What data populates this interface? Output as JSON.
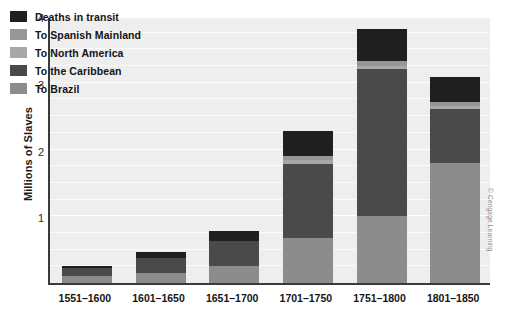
{
  "chart_data": {
    "type": "bar",
    "subtype": "stacked-bar",
    "title": "",
    "xlabel": "",
    "ylabel": "Millions of Slaves",
    "ylim": [
      0,
      4
    ],
    "yticks": [
      1,
      2,
      3,
      4
    ],
    "ytick_labels": [
      "1",
      "2",
      "3",
      "4"
    ],
    "minor_gridline_step": 0.25,
    "grid": true,
    "legend_position": "upper-left-inside",
    "categories": [
      "1551–1600",
      "1601–1650",
      "1651–1700",
      "1701–1750",
      "1751–1800",
      "1801–1850"
    ],
    "series": [
      {
        "name": "To Brazil",
        "color": "#8c8c8c",
        "values": [
          0.1,
          0.15,
          0.25,
          0.68,
          1.0,
          1.8
        ]
      },
      {
        "name": "To the Caribbean",
        "color": "#4a4a4a",
        "values": [
          0.12,
          0.22,
          0.38,
          1.1,
          2.2,
          0.8
        ]
      },
      {
        "name": "To North America",
        "color": "#a8a8a8",
        "values": [
          0.0,
          0.0,
          0.0,
          0.06,
          0.05,
          0.05
        ]
      },
      {
        "name": "To Spanish Mainland",
        "color": "#969696",
        "values": [
          0.0,
          0.0,
          0.0,
          0.06,
          0.08,
          0.06
        ]
      },
      {
        "name": "Deaths in transit",
        "color": "#1f1f1f",
        "values": [
          0.03,
          0.1,
          0.15,
          0.38,
          0.47,
          0.38
        ]
      }
    ],
    "totals": [
      0.25,
      0.47,
      0.78,
      2.28,
      3.8,
      3.09
    ]
  },
  "legend": {
    "items": [
      {
        "label": "Deaths in transit",
        "color": "#1f1f1f"
      },
      {
        "label": "To Spanish Mainland",
        "color": "#969696"
      },
      {
        "label": "To North America",
        "color": "#a8a8a8"
      },
      {
        "label": "To the Caribbean",
        "color": "#4a4a4a"
      },
      {
        "label": "To Brazil",
        "color": "#8c8c8c"
      }
    ]
  },
  "credit": "© Cengage Learning",
  "colors": {
    "plot_background": "#eeeeee",
    "axis": "#3a3a3a",
    "gridline": "#ffffff",
    "text": "#151515"
  }
}
